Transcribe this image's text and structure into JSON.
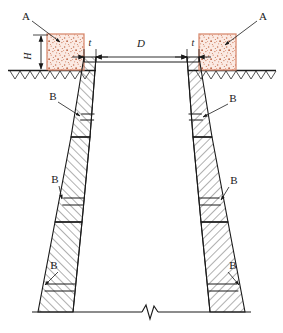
{
  "figure": {
    "kind": "engineering-cross-section",
    "background_color": "#ffffff",
    "line_color": "#1a1a1a",
    "hatch_color": "#3a3a3a",
    "collar_fill_color": "#f6ddd4",
    "collar_border_color": "#d98d72",
    "collar_speck_color": "#c4704f"
  },
  "labels": {
    "collar_left": "A",
    "collar_right": "A",
    "joint_1_left": "B",
    "joint_1_right": "B",
    "joint_2_left": "B",
    "joint_2_right": "B",
    "joint_3_left": "B",
    "joint_3_right": "B"
  },
  "dimensions": {
    "height_collar": "H",
    "thickness_left": "t",
    "clear_span": "D",
    "thickness_right": "t"
  },
  "parts": {
    "collar_block_label": "A",
    "joint_label": "B",
    "ground_line_label": "ground-line",
    "break_symbol_label": "break-line"
  },
  "geometry": {
    "ground_y": 70,
    "collar_top_y": 34,
    "collar_left": {
      "x": 47,
      "y": 34,
      "w": 37,
      "h": 36
    },
    "collar_right": {
      "x": 208,
      "y": 34,
      "w": 37,
      "h": 36
    },
    "dim_line_y": 57,
    "shaft_top_y": 57,
    "shaft_bottom_y": 312,
    "sections": [
      {
        "name": "upper",
        "top": 57,
        "bottom": 137,
        "in_top": 96,
        "in_bot": 90,
        "out_top": 84,
        "out_bot": 71
      },
      {
        "name": "middle",
        "top": 137,
        "bottom": 222,
        "in_top": 90,
        "in_bot": 82,
        "out_top": 71,
        "out_bot": 55
      },
      {
        "name": "lower",
        "top": 222,
        "bottom": 312,
        "in_top": 82,
        "in_bot": 73,
        "out_top": 55,
        "out_bot": 38
      }
    ],
    "joint_y": [
      116,
      201,
      287
    ]
  }
}
